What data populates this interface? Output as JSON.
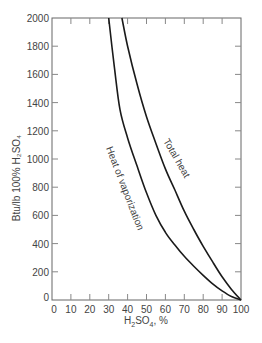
{
  "chart_data": {
    "type": "line",
    "title": "",
    "xlabel": "H2SO4, %",
    "ylabel": "Btu/lb 100% H2SO4",
    "xlim": [
      0,
      100
    ],
    "ylim": [
      0,
      2000
    ],
    "x_ticks": [
      0,
      10,
      20,
      30,
      40,
      50,
      60,
      70,
      80,
      90,
      100
    ],
    "y_ticks": [
      0,
      200,
      400,
      600,
      800,
      1000,
      1200,
      1400,
      1600,
      1800,
      2000
    ],
    "grid": false,
    "legend": "none (curves labeled inline)",
    "series": [
      {
        "name": "Heat of vaporization",
        "x": [
          30,
          33,
          36,
          40,
          45,
          50,
          55,
          60,
          65,
          70,
          75,
          80,
          85,
          90,
          95,
          100
        ],
        "y": [
          2000,
          1650,
          1350,
          1150,
          950,
          760,
          600,
          480,
          390,
          310,
          240,
          175,
          115,
          65,
          25,
          0
        ]
      },
      {
        "name": "Total heat",
        "x": [
          37,
          40,
          45,
          50,
          55,
          60,
          65,
          70,
          75,
          80,
          85,
          90,
          95,
          100
        ],
        "y": [
          2000,
          1800,
          1530,
          1300,
          1110,
          930,
          780,
          630,
          500,
          380,
          270,
          165,
          75,
          0
        ]
      }
    ]
  },
  "labels": {
    "x_axis_title_main": "H",
    "x_axis_title_sub1": "2",
    "x_axis_title_mid": "SO",
    "x_axis_title_sub2": "4",
    "x_axis_title_end": ", %",
    "y_axis_title": "Btu/lb 100% H₂SO₄",
    "curve_vaporization": "Heat of vaporization",
    "curve_total": "Total heat"
  }
}
